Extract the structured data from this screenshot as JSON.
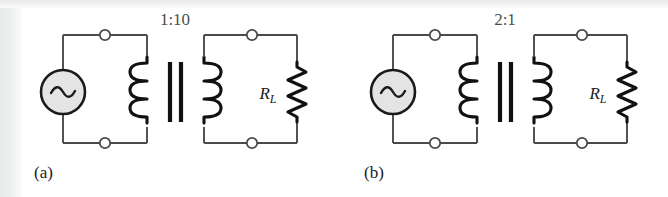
{
  "figure": {
    "background_color": "#ffffff",
    "line_color": "#3a3a3a",
    "core_color": "#111111",
    "source_fill": "#e4e4e4",
    "panels": [
      {
        "id": "a",
        "caption": "(a)",
        "turns_ratio": "1:10",
        "source": {
          "name": "ac-source",
          "symbol": "sine"
        },
        "load": {
          "label_r": "R",
          "label_sub": "L"
        },
        "primary_terminals": 2,
        "secondary_terminals": 2,
        "coil_loops_primary": 3,
        "coil_loops_secondary": 3,
        "core_bars": 2
      },
      {
        "id": "b",
        "caption": "(b)",
        "turns_ratio": "2:1",
        "source": {
          "name": "ac-source",
          "symbol": "sine"
        },
        "load": {
          "label_r": "R",
          "label_sub": "L"
        },
        "primary_terminals": 2,
        "secondary_terminals": 2,
        "coil_loops_primary": 3,
        "coil_loops_secondary": 3,
        "core_bars": 2
      }
    ]
  }
}
